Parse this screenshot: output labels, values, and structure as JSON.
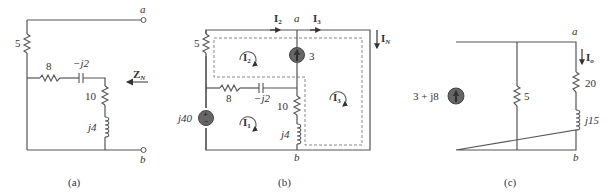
{
  "figures": [
    {
      "id": "a",
      "caption": "(a)",
      "terminals": {
        "top": "a",
        "bottom": "b"
      },
      "components": {
        "r_left": "5",
        "r_mid": "8",
        "c_mid": "−j2",
        "r_right": "10",
        "l_right": "j4"
      },
      "arrow_label": "Z",
      "arrow_sub": "N"
    },
    {
      "id": "b",
      "caption": "(b)",
      "terminals": {
        "top": "a",
        "bottom": "b"
      },
      "components": {
        "r_left": "5",
        "r_mid": "8",
        "c_mid": "−j2",
        "r_right": "10",
        "l_right": "j4",
        "v_source": "j40",
        "i_source": "3"
      },
      "currents": {
        "I2_top": {
          "main": "I",
          "sub": "2"
        },
        "I3_top": {
          "main": "I",
          "sub": "3"
        },
        "IN": {
          "main": "I",
          "sub": "N"
        },
        "mesh1": {
          "main": "I",
          "sub": "1"
        },
        "mesh2": {
          "main": "I",
          "sub": "2"
        },
        "mesh3": {
          "main": "I",
          "sub": "3"
        }
      }
    },
    {
      "id": "c",
      "caption": "(c)",
      "terminals": {
        "top": "a",
        "bottom": "b"
      },
      "components": {
        "i_source": "3 + j8",
        "r_mid": "5",
        "r_right": "20",
        "l_right": "j15"
      },
      "current": {
        "main": "I",
        "sub": "o"
      }
    }
  ]
}
